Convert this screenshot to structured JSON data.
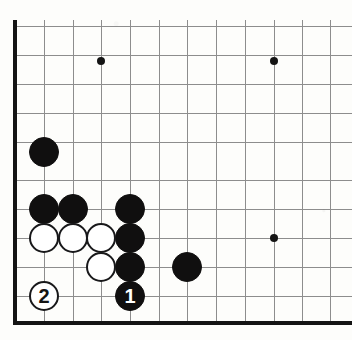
{
  "figure": {
    "board_region": "bottom-left corner",
    "width": 352,
    "height": 340,
    "background_color": "#fdfdfb",
    "line_color": "#8d8d8d",
    "edge_color": "#141414",
    "black_color": "#100f0f",
    "white_color": "#ffffff"
  },
  "grid": {
    "column_count": 12,
    "row_count": 11,
    "columns_x": [
      15,
      44,
      73,
      101,
      130,
      159,
      187,
      216,
      245,
      274,
      302,
      330
    ],
    "rows_y": [
      26,
      55,
      84,
      113,
      142,
      180,
      209,
      238,
      267,
      296,
      323
    ],
    "edges": [
      {
        "side": "left",
        "x": 15,
        "y1": 20,
        "y2": 325,
        "thickness": 4
      },
      {
        "side": "bottom",
        "y": 323,
        "x1": 15,
        "x2": 352,
        "thickness": 4
      }
    ],
    "star_points": [
      {
        "x": 101,
        "y": 61
      },
      {
        "x": 274,
        "y": 61
      },
      {
        "x": 274,
        "y": 238
      }
    ]
  },
  "stones": [
    {
      "color": "black",
      "x": 44,
      "y": 152,
      "radius": 15,
      "label": ""
    },
    {
      "color": "black",
      "x": 44,
      "y": 209,
      "radius": 15,
      "label": ""
    },
    {
      "color": "black",
      "x": 73,
      "y": 209,
      "radius": 15,
      "label": ""
    },
    {
      "color": "black",
      "x": 130,
      "y": 209,
      "radius": 15,
      "label": ""
    },
    {
      "color": "black",
      "x": 130,
      "y": 238,
      "radius": 15,
      "label": ""
    },
    {
      "color": "black",
      "x": 130,
      "y": 267,
      "radius": 15,
      "label": ""
    },
    {
      "color": "black",
      "x": 187,
      "y": 267,
      "radius": 15,
      "label": ""
    },
    {
      "color": "white",
      "x": 44,
      "y": 238,
      "radius": 15,
      "label": ""
    },
    {
      "color": "white",
      "x": 73,
      "y": 238,
      "radius": 15,
      "label": ""
    },
    {
      "color": "white",
      "x": 101,
      "y": 238,
      "radius": 15,
      "label": ""
    },
    {
      "color": "white",
      "x": 101,
      "y": 267,
      "radius": 15,
      "label": ""
    },
    {
      "color": "black",
      "x": 130,
      "y": 296,
      "radius": 15,
      "label": "1"
    },
    {
      "color": "white",
      "x": 44,
      "y": 296,
      "radius": 15,
      "label": "2"
    }
  ],
  "move_labels": {
    "move_one": "1",
    "move_one_color": "black",
    "move_two": "2",
    "move_two_color": "white"
  }
}
